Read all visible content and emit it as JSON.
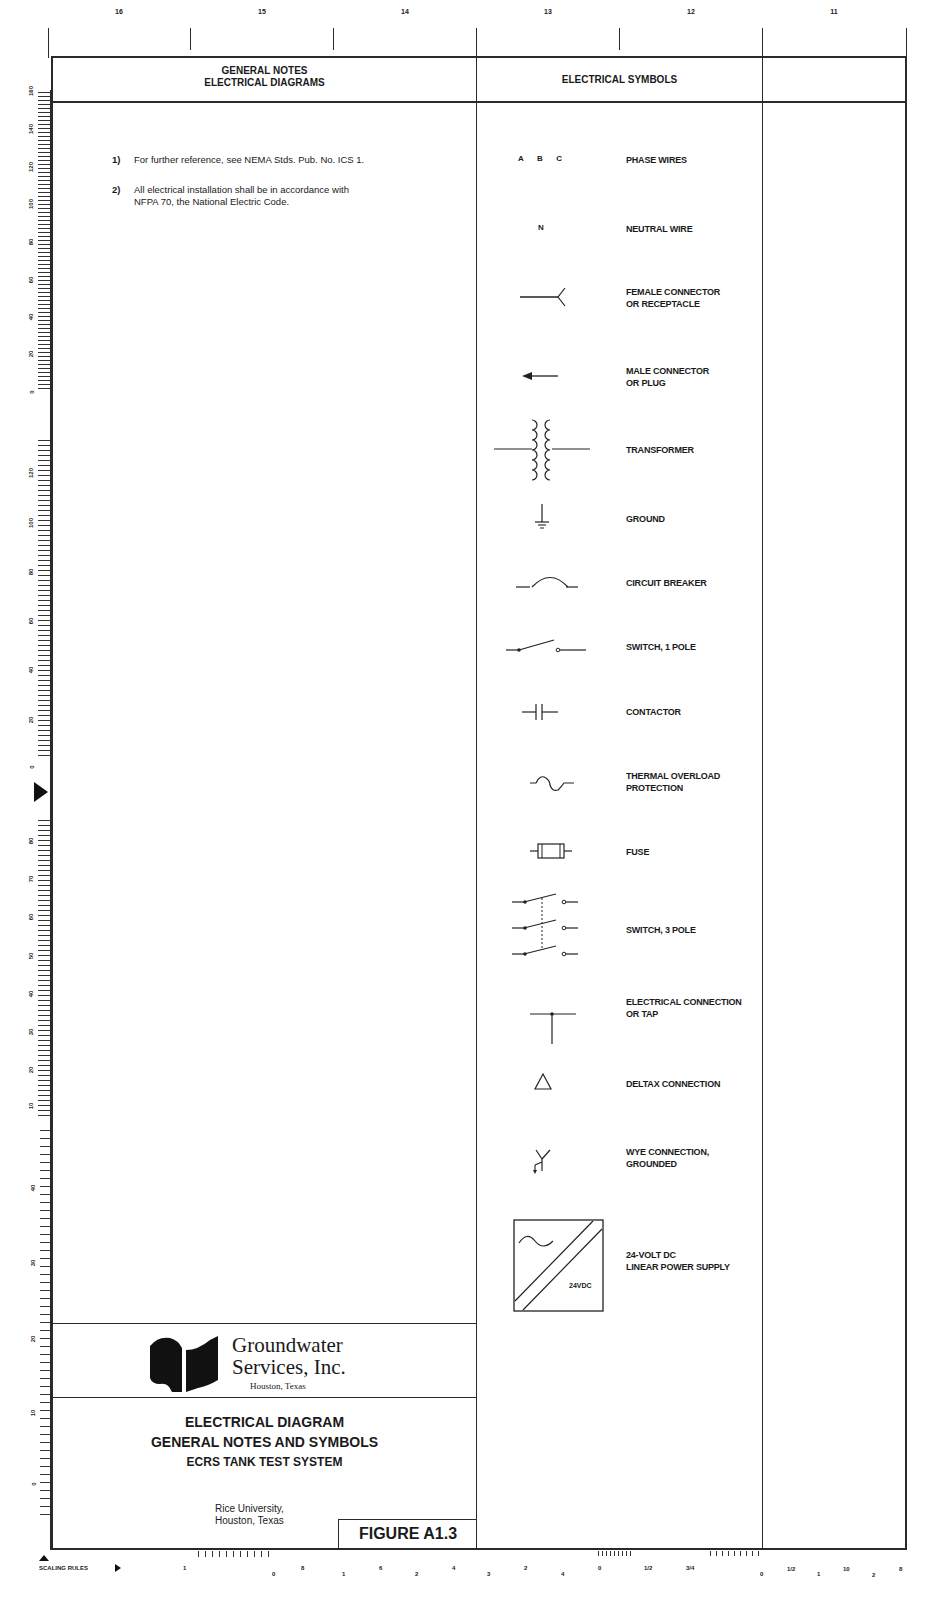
{
  "drawing": {
    "zones": [
      "16",
      "15",
      "14",
      "13",
      "12",
      "11"
    ],
    "header": {
      "notes_title_line1": "GENERAL NOTES",
      "notes_title_line2": "ELECTRICAL DIAGRAMS",
      "symbols_title": "ELECTRICAL SYMBOLS"
    },
    "notes": [
      {
        "num": "1)",
        "lines": [
          "For further reference, see NEMA Stds. Pub. No. ICS 1."
        ]
      },
      {
        "num": "2)",
        "lines": [
          "All electrical installation shall be in accordance with",
          "NFPA 70, the National Electric Code."
        ]
      }
    ],
    "symbols": [
      {
        "icon": "phase-wires-icon",
        "glyph": "A  B  C",
        "label1": "PHASE WIRES",
        "label2": ""
      },
      {
        "icon": "neutral-wire-icon",
        "glyph": "N",
        "label1": "NEUTRAL WIRE",
        "label2": ""
      },
      {
        "icon": "female-connector-icon",
        "label1": "FEMALE CONNECTOR",
        "label2": "OR RECEPTACLE"
      },
      {
        "icon": "male-connector-icon",
        "label1": "MALE CONNECTOR",
        "label2": "OR PLUG"
      },
      {
        "icon": "transformer-icon",
        "label1": "TRANSFORMER",
        "label2": ""
      },
      {
        "icon": "ground-icon",
        "label1": "GROUND",
        "label2": ""
      },
      {
        "icon": "circuit-breaker-icon",
        "label1": "CIRCUIT BREAKER",
        "label2": ""
      },
      {
        "icon": "switch-1-pole-icon",
        "label1": "SWITCH, 1 POLE",
        "label2": ""
      },
      {
        "icon": "contactor-icon",
        "label1": "CONTACTOR",
        "label2": ""
      },
      {
        "icon": "thermal-overload-icon",
        "label1": "THERMAL OVERLOAD",
        "label2": "PROTECTION"
      },
      {
        "icon": "fuse-icon",
        "label1": "FUSE",
        "label2": ""
      },
      {
        "icon": "switch-3-pole-icon",
        "label1": "SWITCH, 3 POLE",
        "label2": ""
      },
      {
        "icon": "electrical-tap-icon",
        "label1": "ELECTRICAL CONNECTION",
        "label2": "OR TAP"
      },
      {
        "icon": "delta-connection-icon",
        "label1": "DELTAX CONNECTION",
        "label2": ""
      },
      {
        "icon": "wye-grounded-icon",
        "label1": "WYE CONNECTION,",
        "label2": "GROUNDED"
      },
      {
        "icon": "power-supply-icon",
        "glyph": "24VDC",
        "label1": "24-VOLT DC",
        "label2": "LINEAR POWER SUPPLY"
      }
    ],
    "company": {
      "name_line1": "Groundwater",
      "name_line2": "Services, Inc.",
      "location": "Houston, Texas"
    },
    "title_block": {
      "line1": "ELECTRICAL DIAGRAM",
      "line2": "GENERAL NOTES AND SYMBOLS",
      "line3": "ECRS TANK TEST SYSTEM",
      "client_line1": "Rice University,",
      "client_line2": "Houston, Texas",
      "figure": "FIGURE A1.3"
    },
    "scaling_rules_label": "SCALING RULES",
    "left_ruler": {
      "section1": [
        "160",
        "140",
        "120",
        "100",
        "80",
        "60",
        "40",
        "20",
        "0",
        "40"
      ],
      "section2": [
        "120",
        "100",
        "80",
        "60",
        "40",
        "20",
        "0",
        "30"
      ],
      "section3": [
        "80",
        "70",
        "60",
        "50",
        "40",
        "30",
        "20",
        "10",
        "0",
        "20"
      ],
      "section4": [
        "40",
        "30",
        "20",
        "10",
        "0",
        "10"
      ]
    },
    "bottom_scale": [
      "1",
      "0",
      "8",
      "1",
      "6",
      "2",
      "4",
      "3",
      "2",
      "4",
      "0",
      "1/2",
      "3/4",
      "0",
      "1/2",
      "1",
      "10",
      "2",
      "8"
    ]
  }
}
